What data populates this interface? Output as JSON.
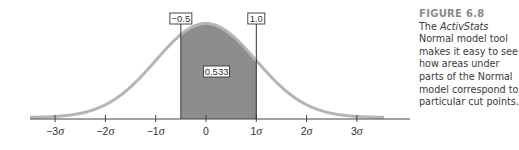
{
  "chart_data": {
    "type": "area",
    "distribution": "Standard Normal",
    "xlabel": "",
    "ylabel": "",
    "x_ticks": [
      -3,
      -2,
      -1,
      0,
      1,
      2,
      3
    ],
    "x_tick_labels": [
      "−3σ",
      "−2σ",
      "−1σ",
      "0",
      "1σ",
      "2σ",
      "3σ"
    ],
    "xlim": [
      -3.5,
      4.1
    ],
    "cut_points": [
      {
        "value": -0.5,
        "label": "−0.5"
      },
      {
        "value": 1.0,
        "label": "1.0"
      }
    ],
    "shaded_region": {
      "from": -0.5,
      "to": 1.0,
      "area": 0.533,
      "label": "0.533"
    },
    "grid": false,
    "legend": null
  },
  "caption": {
    "figure_label": "FIGURE 6.8",
    "text_pre": "The ",
    "text_italic": "ActivStats",
    "text_post": " Normal model tool makes it easy to see how areas under parts of the Normal model correspond to particular cut points."
  },
  "colors": {
    "curve": "#b5b5b5",
    "shade": "#8d8d8d",
    "axis": "#444444",
    "label_border": "#333333",
    "text": "#333333"
  }
}
